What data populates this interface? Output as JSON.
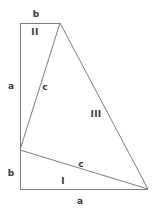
{
  "figure": {
    "stroke_color": "#7d7d7d",
    "label_color": "#3a3a3a",
    "background_color": "#ffffff",
    "stroke_width": 1,
    "canvas": {
      "width": 157,
      "height": 210
    },
    "vertices": {
      "top_left": {
        "x": 20,
        "y": 23
      },
      "apex": {
        "x": 60,
        "y": 23
      },
      "left_mid": {
        "x": 20,
        "y": 150
      },
      "bottom_left": {
        "x": 20,
        "y": 189
      },
      "bottom_right": {
        "x": 148,
        "y": 189
      }
    },
    "edges": [
      {
        "name": "top-edge-b",
        "from": "top_left",
        "to": "apex"
      },
      {
        "name": "left-edge-a",
        "from": "top_left",
        "to": "left_mid"
      },
      {
        "name": "left-edge-b",
        "from": "left_mid",
        "to": "bottom_left"
      },
      {
        "name": "bottom-edge-a",
        "from": "bottom_left",
        "to": "bottom_right"
      },
      {
        "name": "hypotenuse-c-upper",
        "from": "apex",
        "to": "left_mid"
      },
      {
        "name": "hypotenuse-c-lower",
        "from": "left_mid",
        "to": "bottom_right"
      },
      {
        "name": "long-edge-third",
        "from": "apex",
        "to": "bottom_right"
      }
    ],
    "labels": [
      {
        "id": "b-top",
        "text": "b",
        "x": 36,
        "y": 14,
        "kind": "side"
      },
      {
        "id": "II",
        "text": "II",
        "x": 35,
        "y": 32,
        "kind": "region"
      },
      {
        "id": "a-left",
        "text": "a",
        "x": 11,
        "y": 86,
        "kind": "side"
      },
      {
        "id": "c-upper",
        "text": "c",
        "x": 45,
        "y": 87,
        "kind": "side"
      },
      {
        "id": "III",
        "text": "III",
        "x": 96,
        "y": 114,
        "kind": "region"
      },
      {
        "id": "b-left",
        "text": "b",
        "x": 11,
        "y": 173,
        "kind": "side"
      },
      {
        "id": "c-lower",
        "text": "c",
        "x": 81,
        "y": 164,
        "kind": "side"
      },
      {
        "id": "I",
        "text": "I",
        "x": 63,
        "y": 181,
        "kind": "region"
      },
      {
        "id": "a-bottom",
        "text": "a",
        "x": 80,
        "y": 201,
        "kind": "side"
      }
    ]
  }
}
